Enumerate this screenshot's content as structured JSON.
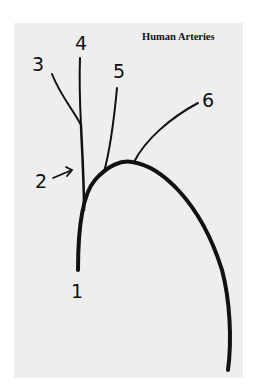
{
  "diagram": {
    "title": "Human Arteries",
    "labels": [
      {
        "id": "1",
        "text": "1"
      },
      {
        "id": "2",
        "text": "2"
      },
      {
        "id": "3",
        "text": "3"
      },
      {
        "id": "4",
        "text": "4"
      },
      {
        "id": "5",
        "text": "5"
      },
      {
        "id": "6",
        "text": "6"
      }
    ],
    "colors": {
      "background": "#eeeeee",
      "ink": "#111111"
    }
  }
}
